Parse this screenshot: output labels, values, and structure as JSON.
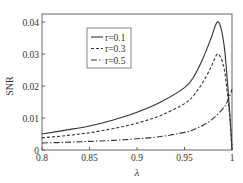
{
  "chart_data": {
    "type": "line",
    "title": "",
    "xlabel": "λ",
    "ylabel": "SNR",
    "xlim": [
      0.8,
      1.0
    ],
    "ylim": [
      0,
      0.042
    ],
    "xticks": [
      0.8,
      0.85,
      0.9,
      0.95,
      1
    ],
    "xtick_labels": [
      "0.8",
      "0.85",
      "0.9",
      "0.95",
      "1"
    ],
    "yticks": [
      0,
      0.01,
      0.02,
      0.03,
      0.04
    ],
    "ytick_labels": [
      "0",
      "0.01",
      "0.02",
      "0.03",
      "0.04"
    ],
    "grid": false,
    "legend_position": "upper left (inset)",
    "series": [
      {
        "name": "r=0.1",
        "style": "solid",
        "x": [
          0.8,
          0.825,
          0.85,
          0.875,
          0.9,
          0.925,
          0.95,
          0.96,
          0.97,
          0.978,
          0.984,
          0.988,
          0.992,
          0.995,
          0.998,
          1.0
        ],
        "y": [
          0.005,
          0.0062,
          0.0075,
          0.0094,
          0.0118,
          0.015,
          0.0195,
          0.023,
          0.029,
          0.035,
          0.0398,
          0.0385,
          0.032,
          0.022,
          0.01,
          0.0
        ]
      },
      {
        "name": "r=0.3",
        "style": "dashed",
        "x": [
          0.8,
          0.825,
          0.85,
          0.875,
          0.9,
          0.925,
          0.95,
          0.96,
          0.97,
          0.978,
          0.984,
          0.988,
          0.992,
          0.995,
          0.998,
          1.0
        ],
        "y": [
          0.0038,
          0.0045,
          0.0054,
          0.0067,
          0.0084,
          0.0108,
          0.0145,
          0.0172,
          0.0215,
          0.026,
          0.0298,
          0.029,
          0.025,
          0.018,
          0.009,
          0.0
        ]
      },
      {
        "name": "r=0.5",
        "style": "dash-dot",
        "x": [
          0.8,
          0.825,
          0.85,
          0.875,
          0.9,
          0.925,
          0.95,
          0.96,
          0.97,
          0.98,
          0.99,
          0.995,
          1.0
        ],
        "y": [
          0.0022,
          0.0024,
          0.0027,
          0.003,
          0.0035,
          0.0042,
          0.0055,
          0.0064,
          0.0078,
          0.0098,
          0.0128,
          0.015,
          0.019
        ]
      }
    ]
  }
}
